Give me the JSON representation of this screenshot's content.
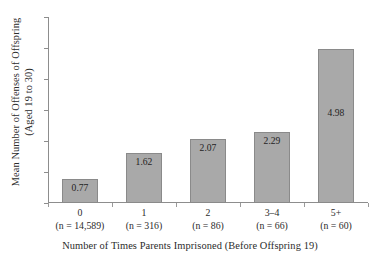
{
  "chart_data": {
    "type": "bar",
    "title": "",
    "subtitle": "",
    "xlabel": "Number of Times Parents Imprisoned (Before Offspring 19)",
    "ylabel_line1": "Mean Number of Offenses of Offspring",
    "ylabel_line2": "(Aged 19 to 30)",
    "categories": [
      "0",
      "1",
      "2",
      "3–4",
      "5+"
    ],
    "category_notes": [
      "(n = 14,589)",
      "(n = 316)",
      "(n = 86)",
      "(n = 66)",
      "(n = 60)"
    ],
    "values": [
      0.77,
      1.62,
      2.07,
      2.29,
      4.98
    ],
    "value_labels": [
      "0.77",
      "1.62",
      "2.07",
      "2.29",
      "4.98"
    ],
    "ylim": [
      0,
      6
    ],
    "y_tick_values": [
      0,
      1,
      2,
      3,
      4,
      5,
      6
    ],
    "y_tick_labels": [
      "",
      "",
      "",
      "",
      "",
      "",
      ""
    ],
    "grid": false,
    "legend": false,
    "legend_position": "none",
    "bar_color": "#a9a9a9",
    "bar_edge_color": "#8a8a8a",
    "axis_color": "#8d8d8d",
    "text_color": "#2b2b2b"
  }
}
